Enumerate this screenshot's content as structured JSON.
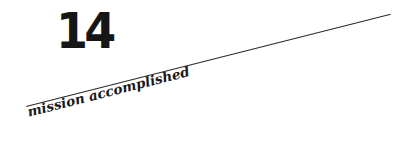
{
  "chapter": {
    "number": "14",
    "title": "mission accomplished"
  },
  "colors": {
    "text": "#161616",
    "rule": "#2a2a2a",
    "background": "#ffffff"
  }
}
